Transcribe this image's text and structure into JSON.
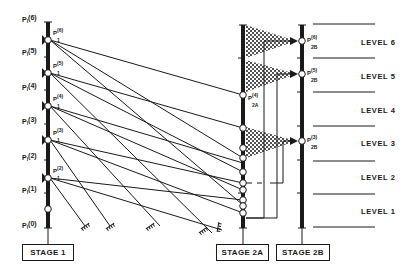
{
  "diagram": {
    "stage1": {
      "label": "STAGE 1",
      "pressure_labels": [
        "P1(6)",
        "P1(5)",
        "P1(4)",
        "P1(3)",
        "P1(2)",
        "P1(1)",
        "P1(0)"
      ],
      "node_labels": [
        "P1(6)",
        "P1(5)",
        "P1(4)",
        "P1(3)",
        "P1(2)"
      ]
    },
    "stage2a": {
      "label": "STAGE 2A",
      "node_label": "P2A(4)"
    },
    "stage2b": {
      "label": "STAGE 2B",
      "node_labels": [
        "P2B(6)",
        "P2B(5)",
        "P2B(3)"
      ]
    },
    "levels": [
      "LEVEL 6",
      "LEVEL 5",
      "LEVEL 4",
      "LEVEL 3",
      "LEVEL 2",
      "LEVEL 1"
    ],
    "colors": {
      "ink": "#1a1a1a",
      "background": "#ffffff"
    }
  }
}
